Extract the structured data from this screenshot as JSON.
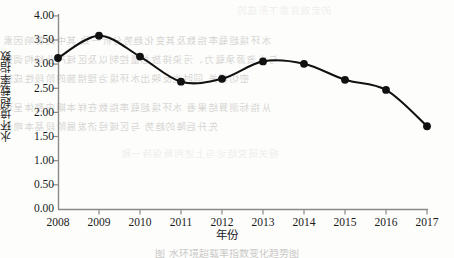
{
  "chart_data": {
    "type": "line",
    "title": "",
    "xlabel": "年份",
    "ylabel": "水环境超载率指数",
    "categories": [
      "2008",
      "2009",
      "2010",
      "2011",
      "2012",
      "2013",
      "2014",
      "2015",
      "2016",
      "2017"
    ],
    "values": [
      3.13,
      3.59,
      3.16,
      2.64,
      2.7,
      3.06,
      3.01,
      2.68,
      2.47,
      1.72
    ],
    "series": [
      {
        "name": "水环境超载率指数",
        "values": [
          3.13,
          3.59,
          3.16,
          2.64,
          2.7,
          3.06,
          3.01,
          2.68,
          2.47,
          1.72
        ]
      }
    ],
    "ylim": [
      0.0,
      4.0
    ],
    "ytick_labels": [
      "4.00",
      "3.50",
      "3.00",
      "2.50",
      "2.00",
      "1.50",
      "1.00",
      "0.50",
      "0.00"
    ],
    "ytick_values": [
      4.0,
      3.5,
      3.0,
      2.5,
      2.0,
      1.5,
      1.0,
      0.5,
      0.0
    ],
    "grid": false,
    "legend": "none",
    "marker": "filled-circle",
    "line_color": "#111111",
    "marker_color": "#111111",
    "axis_color": "#808080",
    "smoothing": true
  },
  "axes": {
    "y_title": "水环境超载率指数",
    "x_title": "年份"
  },
  "background_text": {
    "note": "faint reverse-side bleed-through of scanned page",
    "lines": [
      "的宏观背景下形成的",
      "水环境超载率指数及其变化趋势分析一致 其中的影响因素",
      "与水资源承载力、污染排放总量控制以及区域产业结构调整",
      "密切相关 同时也反映出水环境治理措施的阶段性成效",
      "从指标测算结果看 水环境超载率指数在样本期内整体呈现",
      "先升后降的趋势 与区域经济发展阶段基本吻合",
      "相关研究结论与上述判断保持一致"
    ]
  },
  "caption": "图 水环境超载率指数变化趋势图"
}
